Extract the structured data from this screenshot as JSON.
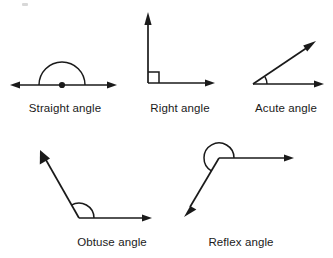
{
  "figure": {
    "background_color": "#ffffff",
    "ink_color": "#1a1a1a",
    "width": 333,
    "height": 258
  },
  "diagrams": [
    {
      "id": "straight-angle",
      "label": "Straight angle",
      "label_x": 65,
      "label_y": 112,
      "measure_degrees": 180,
      "marker": "semicircular-arc-above-vertex",
      "has_vertex_dot": true,
      "vertex": {
        "x": 62,
        "y": 85
      },
      "rays": [
        {
          "name": "left-ray",
          "to_x": 12,
          "to_y": 85,
          "arrow": true
        },
        {
          "name": "right-ray",
          "to_x": 115,
          "to_y": 85,
          "arrow": true
        }
      ],
      "arc": {
        "cx": 62,
        "cy": 85,
        "r": 23,
        "start_deg": 0,
        "end_deg": 180
      }
    },
    {
      "id": "right-angle",
      "label": "Right angle",
      "label_x": 180,
      "label_y": 112,
      "measure_degrees": 90,
      "marker": "square-corner-box",
      "has_vertex_dot": false,
      "vertex": {
        "x": 148,
        "y": 83
      },
      "rays": [
        {
          "name": "vertical-ray",
          "to_x": 148,
          "to_y": 14,
          "arrow": true
        },
        {
          "name": "horizontal-ray",
          "to_x": 213,
          "to_y": 83,
          "arrow": true
        }
      ],
      "box_size": 10
    },
    {
      "id": "acute-angle",
      "label": "Acute angle",
      "label_x": 286,
      "label_y": 112,
      "measure_degrees": 30,
      "marker": "small-arc",
      "has_vertex_dot": false,
      "vertex": {
        "x": 253,
        "y": 84
      },
      "rays": [
        {
          "name": "horizontal-ray",
          "to_x": 322,
          "to_y": 84,
          "arrow": true
        },
        {
          "name": "diagonal-ray",
          "to_x": 314,
          "to_y": 42,
          "arrow": true
        }
      ],
      "arc": {
        "cx": 253,
        "cy": 84,
        "r": 14,
        "start_deg": 0,
        "end_deg": 31
      }
    },
    {
      "id": "obtuse-angle",
      "label": "Obtuse angle",
      "label_x": 112,
      "label_y": 246,
      "measure_degrees": 120,
      "marker": "arc",
      "has_vertex_dot": false,
      "vertex": {
        "x": 79,
        "y": 218
      },
      "rays": [
        {
          "name": "horizontal-ray",
          "to_x": 150,
          "to_y": 218,
          "arrow": true
        },
        {
          "name": "diagonal-ray",
          "to_x": 41,
          "to_y": 155,
          "arrow": true
        }
      ],
      "arc": {
        "cx": 79,
        "cy": 218,
        "r": 15,
        "start_deg": 0,
        "end_deg": 121
      }
    },
    {
      "id": "reflex-angle",
      "label": "Reflex angle",
      "label_x": 241,
      "label_y": 246,
      "measure_degrees": 240,
      "marker": "large-outer-arc",
      "has_vertex_dot": false,
      "vertex": {
        "x": 219,
        "y": 158
      },
      "rays": [
        {
          "name": "horizontal-ray",
          "to_x": 292,
          "to_y": 158,
          "arrow": true
        },
        {
          "name": "diagonal-ray",
          "to_x": 185,
          "to_y": 215,
          "arrow": true
        }
      ],
      "arc": {
        "cx": 219,
        "cy": 158,
        "r": 15,
        "start_deg": 0,
        "end_deg": 239
      }
    }
  ]
}
